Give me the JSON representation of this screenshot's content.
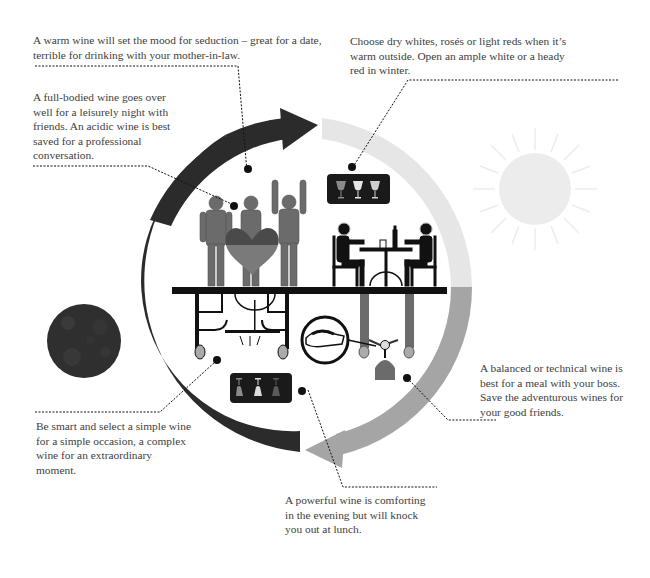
{
  "infographic": {
    "topic": "Choosing wine for the occasion",
    "captions": {
      "seduction": "A warm wine will set the mood for seduction – great for a date, terrible for drinking with your mother-in-law.",
      "friends": "A full-bodied wine goes over well for a leisurely night with friends. An acidic wine is best saved for a professional conversation.",
      "season": "Choose dry whites, rosés or light reds when it’s warm outside. Open an ample white or a heady red in winter.",
      "boss": "A balanced or technical wine is best for a meal with your boss. Save the adventurous wines for your good friends.",
      "occasion": "Be smart and select a simple wine for a simple occasion, a complex wine for an extraordinary moment.",
      "evening": "A powerful wine is comforting in the evening but will knock you out at lunch."
    },
    "icons": {
      "sun": "sun-icon",
      "moon": "moon-icon",
      "upper_glasses": [
        "rose-glass",
        "white-glass",
        "white-glass"
      ],
      "lower_glasses": [
        "rose-glass-inverted",
        "white-glass-inverted",
        "red-glass-inverted"
      ]
    },
    "colors": {
      "dark_arc": "#2b2b2b",
      "light_arc": "#e6e6e6",
      "mid_arc": "#a5a5a5",
      "figure_red": "#6b6b6b",
      "heart_top": "#4a4a4a",
      "heart_bottom": "#7a7a7a",
      "sun": "#ececec",
      "moon": "#2f2f2f"
    }
  }
}
